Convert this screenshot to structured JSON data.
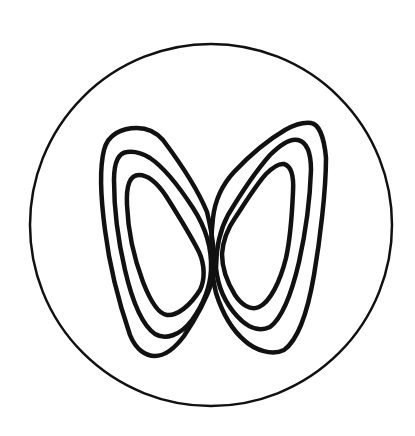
{
  "figure": {
    "description": "Hand-drawn circle enclosing a butterfly-shaped figure made of three nested loops on each side, crossing at the center",
    "colors": {
      "background": "#ffffff",
      "ink": "#111111"
    },
    "circle": {
      "cx": 211,
      "cy": 225,
      "r": 181,
      "stroke_width": 2.5
    },
    "loops": {
      "stroke_width": 4.5,
      "left_wing": [
        {
          "name": "outer",
          "path": "M137,128 C122,128 108,134 104,150 C99,170 101,200 105,230 C109,262 118,300 130,335 C136,350 146,356 155,356 C166,356 175,348 184,336 C196,318 206,300 212,282 C216,262 214,240 207,212 C196,185 178,160 163,140 C155,131 147,128 137,128 Z"
        },
        {
          "name": "middle",
          "path": "M127,152 C118,153 114,162 114,180 C114,205 118,240 125,270 C132,300 142,325 155,334 C165,340 180,336 192,320 C202,306 210,290 211,270 C212,250 206,228 193,208 C180,188 165,168 150,158 C142,153 134,151 127,152 Z"
        },
        {
          "name": "inner",
          "path": "M139,175 C130,175 126,185 127,205 C128,230 134,258 143,282 C150,300 158,314 167,315 C177,316 190,306 200,290 C205,280 205,265 199,252 C190,234 178,215 166,196 C158,184 148,175 139,175 Z"
        }
      ],
      "right_wing": [
        {
          "name": "outer",
          "path": "M311,123 C318,124 324,135 326,158 C326,190 320,240 314,275 C308,310 298,340 284,350 C272,356 255,350 245,341 C232,330 222,312 216,293 C211,272 210,245 213,218 C215,200 222,185 234,172 C250,155 268,140 285,130 C294,125 303,122 311,123 Z"
        },
        {
          "name": "middle",
          "path": "M298,140 C306,142 311,152 311,170 C310,200 305,235 299,262 C292,292 282,318 270,327 C258,333 246,326 237,316 C226,304 218,288 216,268 C216,248 220,230 228,215 C240,195 255,172 270,155 C280,145 290,138 298,140 Z"
        },
        {
          "name": "inner",
          "path": "M284,164 C291,166 294,176 293,192 C292,215 290,240 286,258 C280,282 270,302 259,307 C250,311 241,304 235,295 C227,282 222,268 222,254 C223,240 228,228 235,218 C245,203 256,185 266,174 C272,168 278,163 284,164 Z"
        }
      ]
    }
  }
}
